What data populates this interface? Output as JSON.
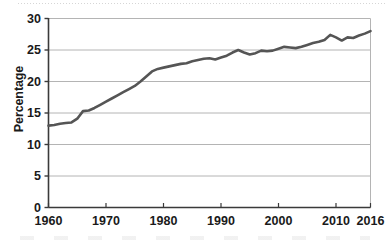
{
  "chart_data": {
    "type": "line",
    "title": "",
    "xlabel": "",
    "ylabel": "Percentage",
    "xlim": [
      1960,
      2016
    ],
    "ylim": [
      0,
      30
    ],
    "grid": "horizontal",
    "legend": "none",
    "line_color": "#555555",
    "gridline_color": "#b4b4b4",
    "axis_color": "#3a3a3a",
    "background_color": "#ffffff",
    "y_ticks": [
      0,
      5,
      10,
      15,
      20,
      25,
      30
    ],
    "y_tick_labels": [
      "0",
      "5",
      "10",
      "15",
      "20",
      "25",
      "30"
    ],
    "x_ticks": [
      1960,
      1970,
      1980,
      1990,
      2000,
      2010,
      2016
    ],
    "x_tick_labels": [
      "1960",
      "1970",
      "1980",
      "1990",
      "2000",
      "2010",
      "2016"
    ],
    "series": [
      {
        "name": "Percentage",
        "x": [
          1960,
          1961,
          1962,
          1963,
          1964,
          1965,
          1966,
          1967,
          1968,
          1969,
          1970,
          1971,
          1972,
          1973,
          1974,
          1975,
          1976,
          1977,
          1978,
          1979,
          1980,
          1981,
          1982,
          1983,
          1984,
          1985,
          1986,
          1987,
          1988,
          1989,
          1990,
          1991,
          1992,
          1993,
          1994,
          1995,
          1996,
          1997,
          1998,
          1999,
          2000,
          2001,
          2002,
          2003,
          2004,
          2005,
          2006,
          2007,
          2008,
          2009,
          2010,
          2011,
          2012,
          2013,
          2014,
          2015,
          2016
        ],
        "values": [
          13.0,
          13.1,
          13.3,
          13.4,
          13.5,
          14.1,
          15.3,
          15.4,
          15.8,
          16.3,
          16.8,
          17.3,
          17.8,
          18.3,
          18.8,
          19.3,
          20.0,
          20.8,
          21.6,
          22.0,
          22.2,
          22.4,
          22.6,
          22.8,
          22.9,
          23.2,
          23.4,
          23.6,
          23.7,
          23.5,
          23.8,
          24.1,
          24.6,
          25.0,
          24.6,
          24.3,
          24.5,
          24.9,
          24.8,
          24.9,
          25.2,
          25.5,
          25.4,
          25.3,
          25.5,
          25.8,
          26.1,
          26.3,
          26.6,
          27.4,
          27.0,
          26.5,
          27.0,
          26.9,
          27.3,
          27.6,
          28.0
        ]
      }
    ]
  },
  "axis": {
    "y_title": "Percentage"
  }
}
